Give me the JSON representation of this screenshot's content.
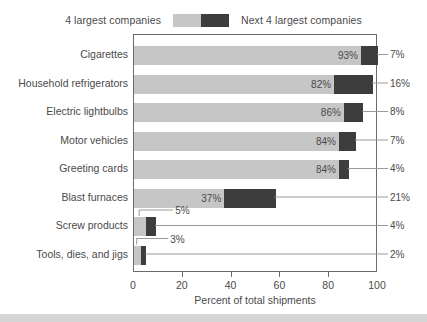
{
  "legend": {
    "left_label": "4 largest companies",
    "right_label": "Next 4 largest companies",
    "left_color": "#c6c6c6",
    "right_color": "#3d3d3d"
  },
  "axis": {
    "x_title": "Percent of total shipments",
    "ticks": [
      "0",
      "20",
      "40",
      "60",
      "80",
      "100"
    ],
    "tick_values": [
      0,
      20,
      40,
      60,
      80,
      100
    ],
    "x_min": 0,
    "x_max": 100
  },
  "rows": [
    {
      "label": "Cigarettes",
      "top_value": "93%",
      "next_value": "7%",
      "top": 93,
      "next": 7,
      "label_inside": true
    },
    {
      "label": "Household refrigerators",
      "top_value": "82%",
      "next_value": "16%",
      "top": 82,
      "next": 16,
      "label_inside": true
    },
    {
      "label": "Electric lightbulbs",
      "top_value": "86%",
      "next_value": "8%",
      "top": 86,
      "next": 8,
      "label_inside": true
    },
    {
      "label": "Motor vehicles",
      "top_value": "84%",
      "next_value": "7%",
      "top": 84,
      "next": 7,
      "label_inside": true
    },
    {
      "label": "Greeting cards",
      "top_value": "84%",
      "next_value": "4%",
      "top": 84,
      "next": 4,
      "label_inside": true
    },
    {
      "label": "Blast furnaces",
      "top_value": "37%",
      "next_value": "21%",
      "top": 37,
      "next": 21,
      "label_inside": true
    },
    {
      "label": "Screw products",
      "top_value": "5%",
      "next_value": "4%",
      "top": 5,
      "next": 4,
      "label_inside": false
    },
    {
      "label": "Tools, dies, and jigs",
      "top_value": "3%",
      "next_value": "2%",
      "top": 3,
      "next": 2,
      "label_inside": false
    }
  ],
  "chart_data": {
    "type": "bar",
    "orientation": "horizontal",
    "stacked": true,
    "title": "",
    "xlabel": "Percent of total shipments",
    "ylabel": "",
    "xlim": [
      0,
      100
    ],
    "xticks": [
      0,
      20,
      40,
      60,
      80,
      100
    ],
    "grid": false,
    "legend_position": "top-center",
    "categories": [
      "Cigarettes",
      "Household refrigerators",
      "Electric lightbulbs",
      "Motor vehicles",
      "Greeting cards",
      "Blast furnaces",
      "Screw products",
      "Tools, dies, and jigs"
    ],
    "series": [
      {
        "name": "4 largest companies",
        "color": "#c6c6c6",
        "values": [
          93,
          82,
          86,
          84,
          84,
          37,
          5,
          3
        ],
        "labels": [
          "93%",
          "82%",
          "86%",
          "84%",
          "84%",
          "37%",
          "5%",
          "3%"
        ]
      },
      {
        "name": "Next 4 largest companies",
        "color": "#3d3d3d",
        "values": [
          7,
          16,
          8,
          7,
          4,
          21,
          4,
          2
        ],
        "labels": [
          "7%",
          "16%",
          "8%",
          "7%",
          "4%",
          "21%",
          "4%",
          "2%"
        ]
      }
    ],
    "totals": [
      100,
      98,
      94,
      91,
      88,
      58,
      9,
      5
    ]
  }
}
